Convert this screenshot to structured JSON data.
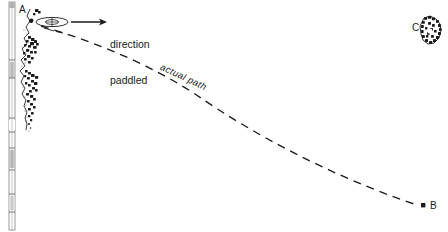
{
  "figure": {
    "type": "diagram",
    "width": 448,
    "height": 232,
    "background_color": "#ffffff",
    "ink_color": "#1a1a1a"
  },
  "labels": {
    "point_a": "A",
    "point_b": "B",
    "point_c": "C",
    "direction_paddled_line1": "direction",
    "direction_paddled_line2": "paddled",
    "actual_path": "actual path"
  },
  "elements": {
    "shoreline_name": "rocky-shoreline",
    "scale_bar_name": "vertical-scale-bar",
    "canoe_name": "canoe-symbol",
    "arrow_name": "direction-arrow",
    "path_name": "actual-path-dashed-curve",
    "island_name": "island-c"
  },
  "geometry": {
    "point_a": [
      31,
      22
    ],
    "point_b": [
      420,
      206
    ],
    "point_c_island_center": [
      430,
      32
    ],
    "arrow_start": [
      72,
      22
    ],
    "arrow_end": [
      107,
      22
    ],
    "canoe_center": [
      52,
      22
    ],
    "path_start": [
      40,
      26
    ],
    "path_end": [
      418,
      206
    ]
  },
  "colors": {
    "ink": "#1a1a1a",
    "paper": "#ffffff",
    "scale_fill": "#cfcfcf",
    "stipple": "#2a2a2a"
  }
}
